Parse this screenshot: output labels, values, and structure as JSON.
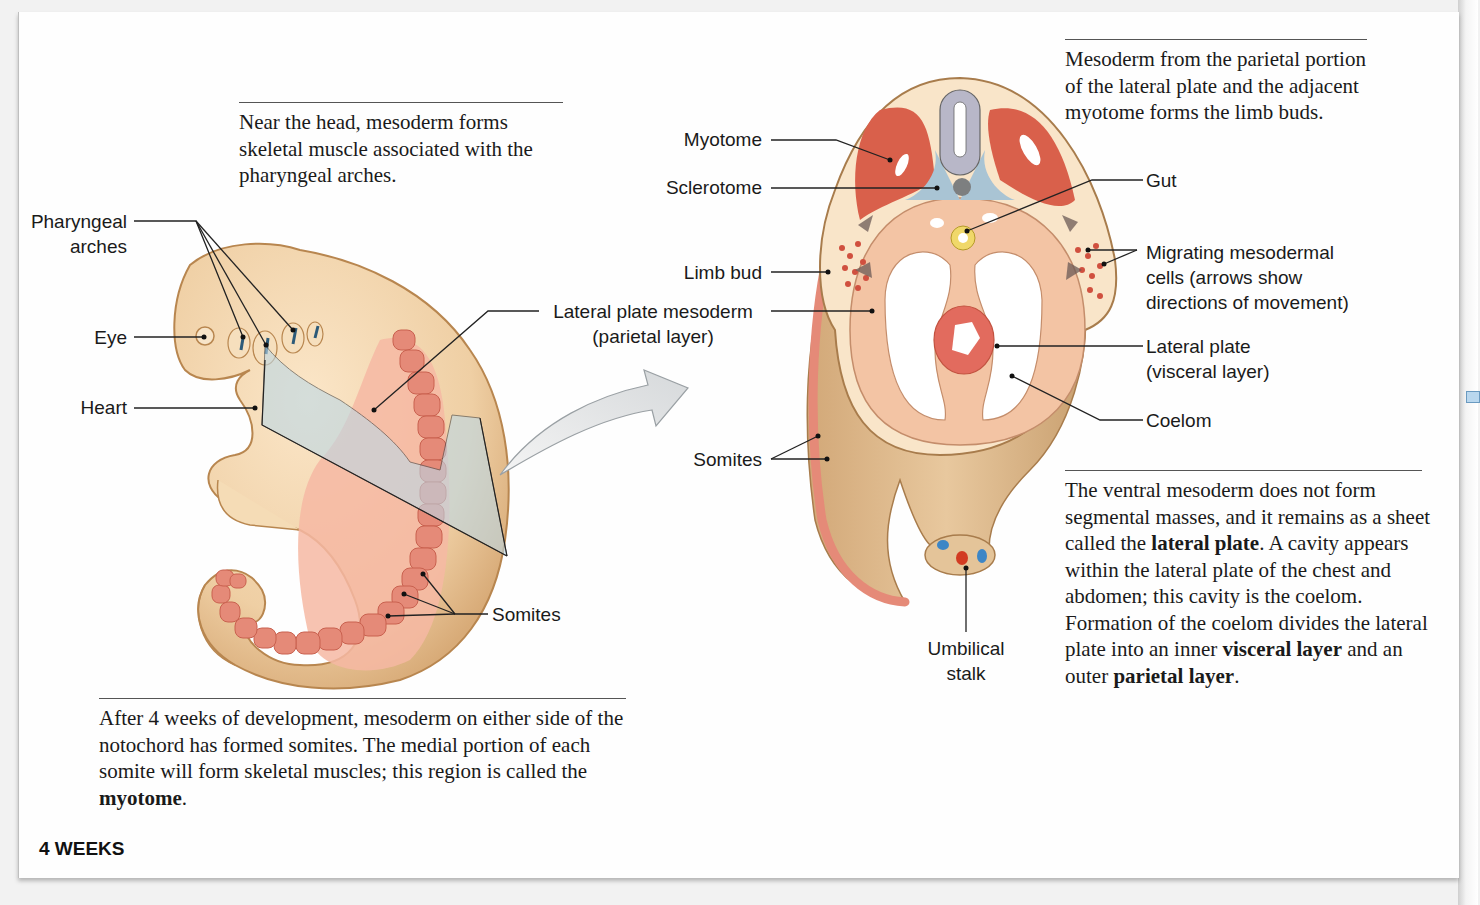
{
  "figure": {
    "stage_label": "4 WEEKS",
    "colors": {
      "embryo_skin": "#efcfa4",
      "embryo_outline": "#b8864f",
      "somite": "#e58a78",
      "lateral_plate": "#f6b9a3",
      "myotome": "#d9604b",
      "sclerotome": "#a9c4d4",
      "neural_tube": "#b8b7c8",
      "gut": "#f0d86a",
      "section_plane": "#bcd8e6",
      "text": "#1a1a1a"
    }
  },
  "captions": {
    "head": "Near the head, mesoderm forms skeletal muscle associated with the pharyngeal arches.",
    "limb": "Mesoderm from the parietal portion of the lateral plate and the adjacent myotome forms the limb buds.",
    "ventral": {
      "part1": "The ventral mesoderm does not form segmental masses, and it remains as a sheet called the ",
      "bold1": "lateral plate",
      "part2": ". A cavity appears within the lateral plate of the chest and abdomen; this cavity is the coelom. Formation of the coelom divides the lateral plate into an inner ",
      "bold2": "visceral layer",
      "part3": " and an outer ",
      "bold3": "parietal layer",
      "part4": "."
    },
    "somites": {
      "part1": "After 4 weeks of development, mesoderm on either side of the notochord has formed somites. The medial portion of each somite will form skeletal muscles; this region is called the ",
      "bold1": "myotome",
      "part2": "."
    }
  },
  "labels": {
    "left_embryo": {
      "pharyngeal_arches_1": "Pharyngeal",
      "pharyngeal_arches_2": "arches",
      "eye": "Eye",
      "heart": "Heart",
      "somites": "Somites"
    },
    "cross_section": {
      "myotome": "Myotome",
      "sclerotome": "Sclerotome",
      "limb_bud": "Limb bud",
      "lateral_plate_mesoderm_1": "Lateral plate mesoderm",
      "lateral_plate_mesoderm_2": "(parietal layer)",
      "somites": "Somites",
      "gut": "Gut",
      "migrating_1": "Migrating mesodermal",
      "migrating_2": "cells (arrows show",
      "migrating_3": "directions of movement)",
      "lateral_plate_visceral_1": "Lateral plate",
      "lateral_plate_visceral_2": "(visceral layer)",
      "coelom": "Coelom",
      "umbilical_1": "Umbilical",
      "umbilical_2": "stalk"
    }
  }
}
